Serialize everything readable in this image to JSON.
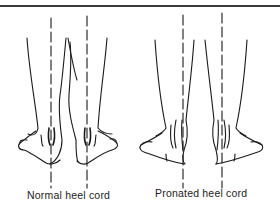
{
  "figure": {
    "panels": [
      {
        "id": "normal",
        "caption": "Normal heel cord"
      },
      {
        "id": "pronated",
        "caption": "Pronated heel cord"
      }
    ],
    "colors": {
      "line": "#1a1a1a",
      "rule": "#3a3a3a",
      "background": "#ffffff"
    }
  }
}
